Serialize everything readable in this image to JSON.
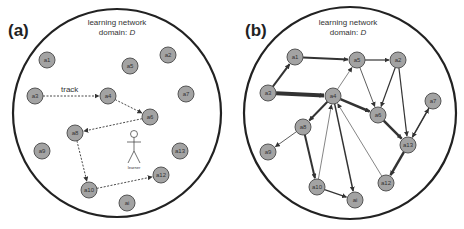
{
  "panels": [
    {
      "id": "a",
      "label": "(a)",
      "domain_line1": "learning network",
      "domain_line2": "domain: ",
      "domain_var": "D",
      "track_label": "track",
      "learner_label": "learner",
      "nodes": [
        {
          "id": "a1",
          "label": "a1",
          "x": 47,
          "y": 60
        },
        {
          "id": "a5",
          "label": "a5",
          "x": 130,
          "y": 66
        },
        {
          "id": "a2",
          "label": "a2",
          "x": 168,
          "y": 55
        },
        {
          "id": "a3",
          "label": "a3",
          "x": 35,
          "y": 96
        },
        {
          "id": "a4",
          "label": "a4",
          "x": 108,
          "y": 96
        },
        {
          "id": "a7",
          "label": "a7",
          "x": 186,
          "y": 94
        },
        {
          "id": "a6",
          "label": "a6",
          "x": 150,
          "y": 117
        },
        {
          "id": "a8",
          "label": "a8",
          "x": 75,
          "y": 133
        },
        {
          "id": "a9",
          "label": "a9",
          "x": 42,
          "y": 151
        },
        {
          "id": "a13",
          "label": "a13",
          "x": 180,
          "y": 151
        },
        {
          "id": "a12",
          "label": "a12",
          "x": 161,
          "y": 175
        },
        {
          "id": "a10",
          "label": "a10",
          "x": 89,
          "y": 190
        },
        {
          "id": "ai",
          "label": "ai",
          "x": 127,
          "y": 203
        }
      ],
      "edges": [
        {
          "from": "a3",
          "to": "a4",
          "style": "dashed"
        },
        {
          "from": "a4",
          "to": "a6",
          "style": "dashed"
        },
        {
          "from": "a6",
          "to": "a8",
          "style": "dashed"
        },
        {
          "from": "a8",
          "to": "a10",
          "style": "dashed"
        },
        {
          "from": "a10",
          "to": "a12",
          "style": "dashed"
        }
      ]
    },
    {
      "id": "b",
      "label": "(b)",
      "domain_line1": "learning network",
      "domain_line2": "domain: ",
      "domain_var": "D",
      "nodes": [
        {
          "id": "a1",
          "label": "a1",
          "x": 295,
          "y": 57
        },
        {
          "id": "a5",
          "label": "a5",
          "x": 357,
          "y": 60
        },
        {
          "id": "a2",
          "label": "a2",
          "x": 398,
          "y": 60
        },
        {
          "id": "a3",
          "label": "a3",
          "x": 268,
          "y": 93
        },
        {
          "id": "a4",
          "label": "a4",
          "x": 333,
          "y": 96
        },
        {
          "id": "a7",
          "label": "a7",
          "x": 433,
          "y": 101
        },
        {
          "id": "a6",
          "label": "a6",
          "x": 378,
          "y": 115
        },
        {
          "id": "a8",
          "label": "a8",
          "x": 303,
          "y": 127
        },
        {
          "id": "a13",
          "label": "a13",
          "x": 408,
          "y": 145
        },
        {
          "id": "a9",
          "label": "a9",
          "x": 268,
          "y": 152
        },
        {
          "id": "a12",
          "label": "a12",
          "x": 386,
          "y": 183
        },
        {
          "id": "a10",
          "label": "a10",
          "x": 317,
          "y": 187
        },
        {
          "id": "ai",
          "label": "ai",
          "x": 355,
          "y": 200
        }
      ],
      "edges": [
        {
          "from": "a3",
          "to": "a1",
          "w": 2
        },
        {
          "from": "a3",
          "to": "a4",
          "w": 4
        },
        {
          "from": "a1",
          "to": "a5",
          "w": 2
        },
        {
          "from": "a5",
          "to": "a2",
          "w": 1.2
        },
        {
          "from": "a4",
          "to": "a5",
          "w": 0.6
        },
        {
          "from": "a5",
          "to": "a6",
          "w": 0.8
        },
        {
          "from": "a2",
          "to": "a6",
          "w": 1.2
        },
        {
          "from": "a2",
          "to": "a13",
          "w": 1.2
        },
        {
          "from": "a4",
          "to": "a6",
          "w": 2.5
        },
        {
          "from": "a4",
          "to": "a8",
          "w": 2
        },
        {
          "from": "a6",
          "to": "a13",
          "w": 2.5
        },
        {
          "from": "a7",
          "to": "a13",
          "w": 1.5
        },
        {
          "from": "a13",
          "to": "a7",
          "w": 0.6
        },
        {
          "from": "a13",
          "to": "a12",
          "w": 2.5
        },
        {
          "from": "a8",
          "to": "a9",
          "w": 0.8
        },
        {
          "from": "a8",
          "to": "a10",
          "w": 2
        },
        {
          "from": "a10",
          "to": "a4",
          "w": 0.6
        },
        {
          "from": "a4",
          "to": "ai",
          "w": 1.5
        },
        {
          "from": "a12",
          "to": "a4",
          "w": 0.6
        },
        {
          "from": "a10",
          "to": "ai",
          "w": 1.2
        }
      ]
    }
  ],
  "colors": {
    "node_fill": "#a3a3a3",
    "node_stroke": "#555555",
    "edge": "#333333",
    "domain_circle": "#222222"
  }
}
